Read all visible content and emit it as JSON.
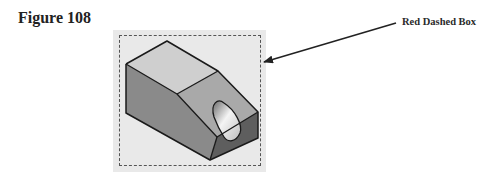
{
  "figure": {
    "title": "Figure 108",
    "callout_label": "Red Dashed Box",
    "selection_box_style": "dashed",
    "model_description": "Isometric view of a block with a chamfered (sloped) end face containing a cylindrical hole"
  },
  "colors": {
    "panel_background": "#e9e9e9",
    "top_face": "#cfcfcf",
    "slope_face": "#a9a9a9",
    "left_face": "#8a8a8a",
    "end_face": "#5e5e5e",
    "outline": "#1a1a1a",
    "arrow": "#222222"
  }
}
